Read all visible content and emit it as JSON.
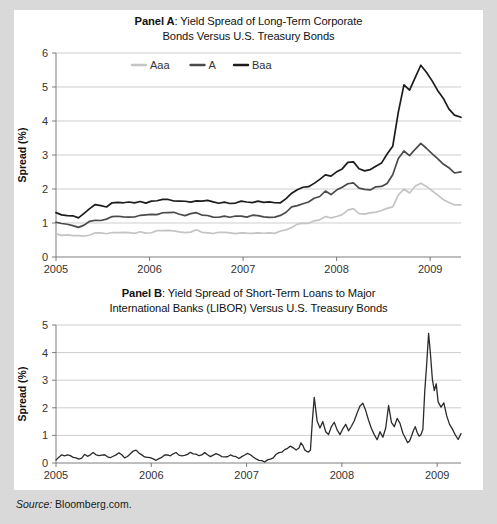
{
  "figure": {
    "source_label": "Source:",
    "source_value": " Bloomberg.com.",
    "background_color": "#d9d9d9",
    "card_color": "#ffffff"
  },
  "panel_a": {
    "tag": "Panel A",
    "title_rest": ": Yield Spread of Long-Term Corporate",
    "title_line2": "Bonds Versus U.S. Treasury Bonds"
  },
  "panel_b": {
    "tag": "Panel B",
    "title_rest": ": Yield Spread of Short-Term Loans to Major",
    "title_line2": "International Banks (LIBOR) Versus U.S. Treasury Bonds"
  },
  "chart_data": [
    {
      "type": "line",
      "id": "panel-a",
      "title": "Panel A: Yield Spread of Long-Term Corporate Bonds Versus U.S. Treasury Bonds",
      "xlabel": "",
      "ylabel": "Spread (%)",
      "ylim": [
        0,
        6
      ],
      "yticks": [
        0,
        1,
        2,
        3,
        4,
        5,
        6
      ],
      "xlim": [
        2005.0,
        2009.33
      ],
      "xticks": [
        2005,
        2006,
        2007,
        2008,
        2009
      ],
      "xticklabels": [
        "2005",
        "2006",
        "2007",
        "2008",
        "2009"
      ],
      "grid": true,
      "legend_position": "top-center",
      "legend": [
        {
          "name": "Aaa",
          "color": "#c4c4c4"
        },
        {
          "name": "A",
          "color": "#4a4a4a"
        },
        {
          "name": "Baa",
          "color": "#1c1c1c"
        }
      ],
      "x": [
        2005.0,
        2005.06,
        2005.12,
        2005.18,
        2005.24,
        2005.3,
        2005.36,
        2005.42,
        2005.48,
        2005.54,
        2005.6,
        2005.66,
        2005.72,
        2005.78,
        2005.84,
        2005.9,
        2005.96,
        2006.02,
        2006.08,
        2006.14,
        2006.2,
        2006.26,
        2006.32,
        2006.38,
        2006.44,
        2006.5,
        2006.56,
        2006.62,
        2006.68,
        2006.74,
        2006.8,
        2006.86,
        2006.92,
        2006.98,
        2007.04,
        2007.1,
        2007.16,
        2007.22,
        2007.28,
        2007.34,
        2007.4,
        2007.46,
        2007.52,
        2007.58,
        2007.64,
        2007.7,
        2007.76,
        2007.82,
        2007.88,
        2007.94,
        2008.0,
        2008.06,
        2008.12,
        2008.18,
        2008.24,
        2008.3,
        2008.36,
        2008.42,
        2008.48,
        2008.54,
        2008.6,
        2008.66,
        2008.72,
        2008.78,
        2008.84,
        2008.9,
        2008.96,
        2009.02,
        2009.08,
        2009.14,
        2009.2,
        2009.26,
        2009.33
      ],
      "series": [
        {
          "name": "Baa",
          "color": "#1c1c1c",
          "values": [
            1.3,
            1.25,
            1.22,
            1.2,
            1.18,
            1.3,
            1.42,
            1.5,
            1.48,
            1.5,
            1.55,
            1.58,
            1.6,
            1.58,
            1.6,
            1.62,
            1.6,
            1.62,
            1.65,
            1.68,
            1.7,
            1.68,
            1.66,
            1.64,
            1.66,
            1.68,
            1.65,
            1.62,
            1.6,
            1.6,
            1.62,
            1.6,
            1.58,
            1.6,
            1.58,
            1.6,
            1.62,
            1.6,
            1.58,
            1.6,
            1.62,
            1.7,
            1.85,
            2.0,
            2.05,
            2.1,
            2.2,
            2.3,
            2.45,
            2.35,
            2.5,
            2.6,
            2.75,
            2.8,
            2.62,
            2.55,
            2.6,
            2.7,
            2.8,
            3.0,
            3.3,
            4.3,
            5.1,
            4.9,
            5.3,
            5.65,
            5.45,
            5.2,
            4.9,
            4.7,
            4.4,
            4.2,
            4.1
          ]
        },
        {
          "name": "A",
          "color": "#4a4a4a",
          "values": [
            1.0,
            0.98,
            0.95,
            0.93,
            0.9,
            0.95,
            1.05,
            1.12,
            1.1,
            1.12,
            1.15,
            1.18,
            1.2,
            1.18,
            1.2,
            1.22,
            1.2,
            1.22,
            1.25,
            1.28,
            1.3,
            1.28,
            1.26,
            1.24,
            1.26,
            1.28,
            1.25,
            1.22,
            1.2,
            1.2,
            1.22,
            1.2,
            1.18,
            1.2,
            1.18,
            1.2,
            1.22,
            1.2,
            1.18,
            1.2,
            1.25,
            1.35,
            1.45,
            1.55,
            1.6,
            1.65,
            1.72,
            1.8,
            1.95,
            1.85,
            1.98,
            2.05,
            2.18,
            2.22,
            2.05,
            1.98,
            2.0,
            2.05,
            2.1,
            2.2,
            2.4,
            2.9,
            3.15,
            3.0,
            3.2,
            3.35,
            3.2,
            3.05,
            2.9,
            2.7,
            2.6,
            2.5,
            2.5
          ]
        },
        {
          "name": "Aaa",
          "color": "#c4c4c4",
          "values": [
            0.65,
            0.64,
            0.63,
            0.62,
            0.6,
            0.62,
            0.66,
            0.7,
            0.69,
            0.7,
            0.72,
            0.74,
            0.75,
            0.73,
            0.72,
            0.72,
            0.7,
            0.72,
            0.75,
            0.78,
            0.8,
            0.78,
            0.76,
            0.74,
            0.76,
            0.78,
            0.76,
            0.74,
            0.72,
            0.72,
            0.74,
            0.72,
            0.7,
            0.72,
            0.7,
            0.72,
            0.74,
            0.72,
            0.7,
            0.72,
            0.75,
            0.82,
            0.9,
            0.95,
            1.0,
            1.02,
            1.08,
            1.12,
            1.2,
            1.15,
            1.2,
            1.25,
            1.35,
            1.4,
            1.3,
            1.26,
            1.28,
            1.3,
            1.35,
            1.4,
            1.5,
            1.85,
            2.0,
            1.9,
            2.05,
            2.2,
            2.1,
            1.95,
            1.8,
            1.7,
            1.6,
            1.52,
            1.5
          ]
        }
      ]
    },
    {
      "type": "line",
      "id": "panel-b",
      "title": "Panel B: Yield Spread of Short-Term Loans to Major International Banks (LIBOR) Versus U.S. Treasury Bonds",
      "xlabel": "",
      "ylabel": "Spread (%)",
      "ylim": [
        0,
        5
      ],
      "yticks": [
        0,
        1,
        2,
        3,
        4,
        5
      ],
      "xlim": [
        2005.0,
        2009.25
      ],
      "xticks": [
        2005,
        2006,
        2007,
        2008,
        2009
      ],
      "xticklabels": [
        "2005",
        "2006",
        "2007",
        "2008",
        "2009"
      ],
      "grid": true,
      "legend_position": "none",
      "series": [
        {
          "name": "LIBOR spread",
          "color": "#2b2b2b",
          "x": [
            2005.0,
            2005.03,
            2005.06,
            2005.09,
            2005.12,
            2005.15,
            2005.18,
            2005.21,
            2005.24,
            2005.27,
            2005.3,
            2005.33,
            2005.36,
            2005.39,
            2005.42,
            2005.45,
            2005.48,
            2005.51,
            2005.54,
            2005.57,
            2005.6,
            2005.63,
            2005.66,
            2005.69,
            2005.72,
            2005.75,
            2005.78,
            2005.81,
            2005.84,
            2005.87,
            2005.9,
            2005.93,
            2005.96,
            2005.99,
            2006.02,
            2006.05,
            2006.08,
            2006.11,
            2006.14,
            2006.17,
            2006.2,
            2006.23,
            2006.26,
            2006.29,
            2006.32,
            2006.35,
            2006.38,
            2006.41,
            2006.44,
            2006.47,
            2006.5,
            2006.53,
            2006.56,
            2006.59,
            2006.62,
            2006.65,
            2006.68,
            2006.71,
            2006.74,
            2006.77,
            2006.8,
            2006.83,
            2006.86,
            2006.89,
            2006.92,
            2006.95,
            2006.98,
            2007.01,
            2007.04,
            2007.07,
            2007.1,
            2007.13,
            2007.16,
            2007.19,
            2007.22,
            2007.25,
            2007.28,
            2007.31,
            2007.34,
            2007.37,
            2007.4,
            2007.43,
            2007.46,
            2007.49,
            2007.52,
            2007.55,
            2007.57,
            2007.59,
            2007.61,
            2007.63,
            2007.65,
            2007.67,
            2007.69,
            2007.71,
            2007.74,
            2007.77,
            2007.8,
            2007.83,
            2007.86,
            2007.89,
            2007.92,
            2007.95,
            2007.98,
            2008.01,
            2008.04,
            2008.07,
            2008.1,
            2008.13,
            2008.16,
            2008.19,
            2008.22,
            2008.25,
            2008.28,
            2008.31,
            2008.34,
            2008.37,
            2008.4,
            2008.43,
            2008.46,
            2008.49,
            2008.52,
            2008.55,
            2008.58,
            2008.61,
            2008.64,
            2008.67,
            2008.69,
            2008.71,
            2008.73,
            2008.75,
            2008.77,
            2008.79,
            2008.81,
            2008.83,
            2008.85,
            2008.87,
            2008.89,
            2008.91,
            2008.93,
            2008.95,
            2008.97,
            2008.99,
            2009.01,
            2009.04,
            2009.07,
            2009.1,
            2009.13,
            2009.16,
            2009.19,
            2009.22,
            2009.25
          ],
          "values": [
            0.1,
            0.22,
            0.3,
            0.25,
            0.32,
            0.28,
            0.2,
            0.15,
            0.12,
            0.2,
            0.28,
            0.22,
            0.3,
            0.35,
            0.3,
            0.26,
            0.3,
            0.28,
            0.22,
            0.18,
            0.25,
            0.32,
            0.38,
            0.3,
            0.22,
            0.26,
            0.34,
            0.4,
            0.45,
            0.38,
            0.3,
            0.24,
            0.2,
            0.16,
            0.12,
            0.1,
            0.14,
            0.2,
            0.26,
            0.3,
            0.28,
            0.32,
            0.36,
            0.3,
            0.26,
            0.3,
            0.34,
            0.4,
            0.36,
            0.3,
            0.26,
            0.3,
            0.35,
            0.3,
            0.25,
            0.3,
            0.36,
            0.32,
            0.26,
            0.2,
            0.26,
            0.32,
            0.28,
            0.22,
            0.18,
            0.24,
            0.3,
            0.36,
            0.3,
            0.24,
            0.18,
            0.12,
            0.08,
            0.06,
            0.1,
            0.16,
            0.22,
            0.3,
            0.38,
            0.42,
            0.5,
            0.56,
            0.62,
            0.55,
            0.48,
            0.55,
            0.7,
            0.62,
            0.5,
            0.42,
            0.38,
            0.45,
            1.5,
            2.35,
            1.55,
            1.3,
            1.5,
            1.15,
            1.0,
            1.35,
            1.5,
            1.2,
            1.0,
            1.25,
            1.4,
            1.15,
            1.3,
            1.55,
            1.8,
            2.1,
            2.2,
            1.9,
            1.55,
            1.25,
            1.0,
            0.85,
            1.1,
            0.95,
            1.25,
            2.05,
            1.5,
            1.35,
            1.6,
            1.45,
            1.1,
            0.85,
            0.75,
            0.8,
            0.95,
            1.15,
            1.35,
            1.1,
            0.95,
            1.05,
            1.2,
            2.6,
            3.6,
            4.7,
            3.9,
            3.0,
            2.6,
            2.9,
            2.2,
            2.0,
            2.15,
            1.7,
            1.4,
            1.2,
            1.05,
            0.88,
            1.05
          ]
        }
      ]
    }
  ]
}
